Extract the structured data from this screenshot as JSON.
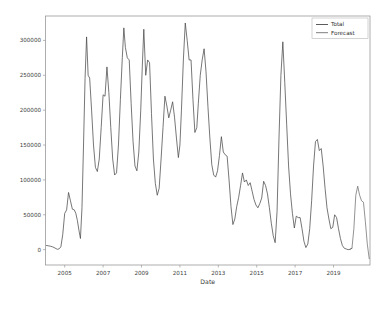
{
  "figure": {
    "background_color": "#ffffff",
    "frame_color": "#9a9a9a",
    "width": 382,
    "height": 309
  },
  "chart_data": {
    "type": "line",
    "title": "",
    "xlabel": "Date",
    "ylabel": "",
    "grid": false,
    "legend_position": "upper right",
    "xlim": [
      2004.0,
      2020.9
    ],
    "ylim": [
      -22000,
      335000
    ],
    "xticks": [
      "2005",
      "2007",
      "2009",
      "2011",
      "2013",
      "2015",
      "2017",
      "2019"
    ],
    "xtick_values": [
      2005,
      2007,
      2009,
      2011,
      2013,
      2015,
      2017,
      2019
    ],
    "yticks": [
      "0",
      "50000",
      "100000",
      "150000",
      "200000",
      "250000",
      "300000"
    ],
    "ytick_values": [
      0,
      50000,
      100000,
      150000,
      200000,
      250000,
      300000
    ],
    "series": [
      {
        "name": "Total",
        "color": "#4a4a4a",
        "x": [
          2004.05,
          2004.15,
          2004.25,
          2004.35,
          2004.45,
          2004.55,
          2004.62,
          2004.7,
          2004.8,
          2004.9,
          2005.0,
          2005.1,
          2005.2,
          2005.3,
          2005.4,
          2005.5,
          2005.58,
          2005.66,
          2005.74,
          2005.82,
          2005.9,
          2005.98,
          2006.06,
          2006.14,
          2006.22,
          2006.3,
          2006.4,
          2006.5,
          2006.6,
          2006.7,
          2006.8,
          2006.9,
          2007.0,
          2007.1,
          2007.2,
          2007.3,
          2007.4,
          2007.5,
          2007.6,
          2007.7,
          2007.8,
          2007.9,
          2008.0,
          2008.08,
          2008.16,
          2008.26,
          2008.36,
          2008.46,
          2008.56,
          2008.66,
          2008.76,
          2008.86,
          2008.96,
          2009.04,
          2009.12,
          2009.22,
          2009.32,
          2009.42,
          2009.52,
          2009.62,
          2009.72,
          2009.82,
          2009.92,
          2010.02,
          2010.12,
          2010.22,
          2010.32,
          2010.42,
          2010.52,
          2010.62,
          2010.72,
          2010.82,
          2010.92,
          2011.0,
          2011.08,
          2011.18,
          2011.28,
          2011.38,
          2011.48,
          2011.58,
          2011.68,
          2011.78,
          2011.88,
          2011.96,
          2012.06,
          2012.16,
          2012.26,
          2012.36,
          2012.46,
          2012.56,
          2012.66,
          2012.76,
          2012.86,
          2012.96,
          2013.06,
          2013.16,
          2013.26,
          2013.36,
          2013.46,
          2013.56,
          2013.66,
          2013.76,
          2013.86,
          2013.96,
          2014.06,
          2014.16,
          2014.26,
          2014.36,
          2014.46,
          2014.56,
          2014.66,
          2014.76,
          2014.86,
          2014.96,
          2015.06,
          2015.16,
          2015.26,
          2015.36,
          2015.46,
          2015.56,
          2015.66,
          2015.76,
          2015.86,
          2015.96,
          2016.06,
          2016.16,
          2016.26,
          2016.36,
          2016.46,
          2016.56,
          2016.66,
          2016.76,
          2016.86,
          2016.96,
          2017.06,
          2017.16,
          2017.26,
          2017.36,
          2017.46,
          2017.56,
          2017.66,
          2017.76,
          2017.86,
          2017.96,
          2018.06,
          2018.16,
          2018.26,
          2018.36,
          2018.46,
          2018.56,
          2018.66,
          2018.76,
          2018.86,
          2018.96,
          2019.06,
          2019.16,
          2019.26,
          2019.36,
          2019.46,
          2019.56,
          2019.66,
          2019.76,
          2019.86,
          2019.96
        ],
        "values": [
          6000,
          5500,
          5000,
          4200,
          3000,
          1500,
          500,
          1000,
          4000,
          22000,
          52000,
          57000,
          82000,
          70000,
          58000,
          57000,
          52000,
          42000,
          28000,
          16000,
          60000,
          150000,
          245000,
          305000,
          250000,
          246000,
          200000,
          150000,
          118000,
          112000,
          130000,
          175000,
          222000,
          220000,
          262000,
          225000,
          175000,
          130000,
          107000,
          110000,
          150000,
          215000,
          275000,
          318000,
          290000,
          275000,
          272000,
          210000,
          155000,
          120000,
          113000,
          140000,
          200000,
          262000,
          316000,
          250000,
          272000,
          268000,
          195000,
          130000,
          95000,
          78000,
          88000,
          130000,
          175000,
          220000,
          206000,
          189000,
          200000,
          212000,
          190000,
          160000,
          132000,
          150000,
          200000,
          272000,
          325000,
          300000,
          272000,
          272000,
          215000,
          168000,
          175000,
          210000,
          250000,
          272000,
          288000,
          255000,
          205000,
          160000,
          122000,
          107000,
          104000,
          113000,
          135000,
          162000,
          140000,
          136000,
          134000,
          100000,
          62000,
          36000,
          44000,
          62000,
          75000,
          92000,
          110000,
          97000,
          100000,
          92000,
          96000,
          84000,
          72000,
          64000,
          60000,
          66000,
          74000,
          98000,
          92000,
          80000,
          60000,
          38000,
          20000,
          10000,
          55000,
          160000,
          250000,
          298000,
          240000,
          180000,
          120000,
          80000,
          52000,
          31000,
          48000,
          46000,
          46000,
          30000,
          12000,
          3000,
          8000,
          30000,
          70000,
          120000,
          155000,
          158000,
          142000,
          145000,
          120000,
          88000,
          60000,
          44000,
          30000,
          32000,
          50000,
          46000,
          30000,
          16000,
          6000,
          2000,
          1000,
          0,
          500,
          2000
        ]
      },
      {
        "name": "Forecast",
        "color": "#6f6f6f",
        "x": [
          2019.86,
          2019.96,
          2020.06,
          2020.16,
          2020.26,
          2020.36,
          2020.46,
          2020.56,
          2020.66,
          2020.76,
          2020.86
        ],
        "values": [
          500,
          2000,
          30000,
          78000,
          91000,
          78000,
          70000,
          68000,
          40000,
          8000,
          -13000
        ]
      }
    ]
  },
  "legend": {
    "entries": [
      {
        "label": "Total",
        "color": "#4a4a4a"
      },
      {
        "label": "Forecast",
        "color": "#6f6f6f"
      }
    ]
  }
}
